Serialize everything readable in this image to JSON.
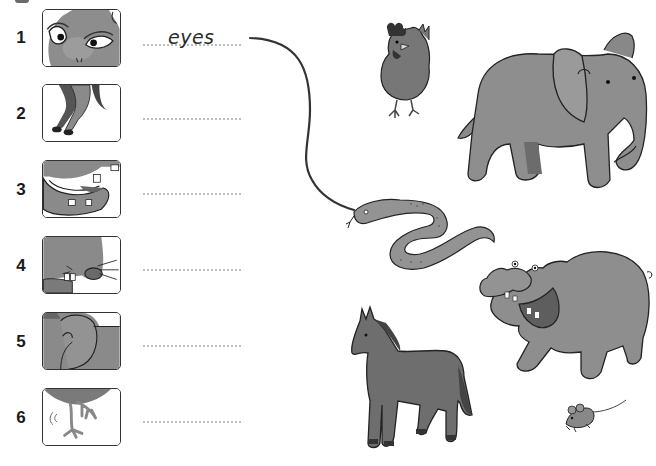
{
  "exercise": {
    "rows": [
      {
        "number": "1",
        "part_picture": "animal-eyes",
        "answer": "eyes"
      },
      {
        "number": "2",
        "part_picture": "animal-legs-hooves",
        "answer": ""
      },
      {
        "number": "3",
        "part_picture": "animal-mouth-teeth",
        "answer": ""
      },
      {
        "number": "4",
        "part_picture": "animal-nose-whiskers",
        "answer": ""
      },
      {
        "number": "5",
        "part_picture": "animal-ear",
        "answer": ""
      },
      {
        "number": "6",
        "part_picture": "animal-claws-feet",
        "answer": ""
      }
    ],
    "match_line": {
      "from_row": "1",
      "to_animal": "snake"
    },
    "animals": [
      "hen",
      "elephant",
      "snake",
      "hippo",
      "horse",
      "mouse"
    ]
  },
  "colors": {
    "animal_fill": "#8a8a8a",
    "animal_dark": "#5e5e5e",
    "outline": "#2b2b2b",
    "dotted_line": "#bdbdbd",
    "match_line": "#333333"
  }
}
